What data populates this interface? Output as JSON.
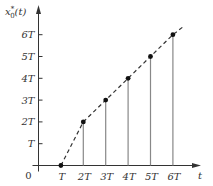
{
  "chart_data": {
    "type": "line",
    "title": "",
    "xlabel": "t",
    "ylabel": "x*₀(t)",
    "ylabel_parts": {
      "base": "x",
      "sup": "*",
      "sub": "0",
      "arg": "(t)"
    },
    "origin_label": "0",
    "x_ticks": [
      "T",
      "2T",
      "3T",
      "4T",
      "5T",
      "6T"
    ],
    "y_ticks": [
      "T",
      "2T",
      "3T",
      "4T",
      "5T",
      "6T"
    ],
    "x_units": [
      1,
      2,
      3,
      4,
      5,
      6
    ],
    "points": [
      {
        "x": 1,
        "y": 0,
        "label": "(T, 0)"
      },
      {
        "x": 2,
        "y": 2,
        "label": "(2T, 2T)"
      },
      {
        "x": 3,
        "y": 3,
        "label": "(3T, 3T)"
      },
      {
        "x": 4,
        "y": 4,
        "label": "(4T, 4T)"
      },
      {
        "x": 5,
        "y": 5,
        "label": "(5T, 5T)"
      },
      {
        "x": 6,
        "y": 6,
        "label": "(6T, 6T)"
      }
    ],
    "line_style": "dashed",
    "stems": "vertical lines from each sample point to t-axis",
    "dashed_extension_end": {
      "x": 6.5,
      "y": 6.4
    },
    "xlim": [
      0,
      7
    ],
    "ylim": [
      0,
      7
    ],
    "grid": false,
    "legend": null
  },
  "colors": {
    "axis": "#333333",
    "stem": "#888888",
    "dash": "#333333",
    "point": "#111111"
  }
}
